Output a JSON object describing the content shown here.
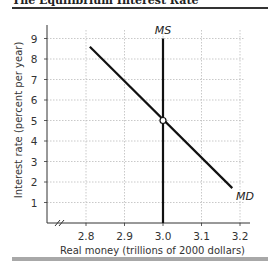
{
  "figure": {
    "title": "The Equilibrium Interest Rate"
  },
  "chart_data": {
    "type": "line",
    "title": "The Equilibrium Interest Rate",
    "xlabel": "Real money (trillions of 2000 dollars)",
    "ylabel": "Interest rate (percent per year)",
    "xlim": [
      2.75,
      3.22
    ],
    "ylim": [
      0,
      9.5
    ],
    "x_ticks": [
      "2.8",
      "2.9",
      "3.0",
      "3.1",
      "3.2"
    ],
    "y_ticks": [
      "1",
      "2",
      "3",
      "4",
      "5",
      "6",
      "7",
      "8",
      "9"
    ],
    "grid": true,
    "axis_break": "x",
    "series": [
      {
        "name": "MD",
        "label": "MD",
        "points": [
          [
            2.81,
            8.6
          ],
          [
            3.18,
            1.7
          ]
        ]
      },
      {
        "name": "MS",
        "label": "MS",
        "points": [
          [
            3.0,
            0
          ],
          [
            3.0,
            9.0
          ]
        ]
      }
    ],
    "equilibrium": {
      "x": 3.0,
      "y": 5,
      "marker": "open-circle"
    },
    "colors": {
      "lines": "#111111",
      "grid": "#bbbbbb",
      "text": "#333333"
    }
  }
}
